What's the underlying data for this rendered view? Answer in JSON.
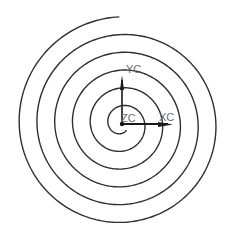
{
  "diagram": {
    "type": "archimedean-spiral",
    "center": [
      122,
      124
    ],
    "spiral": {
      "a": 5,
      "b": 2.83,
      "start_angle_pi": 0.3,
      "end_angle_pi": 11.5,
      "stroke": "#2e2e2e"
    },
    "axes": {
      "x_label": "XC",
      "y_label": "YC",
      "z_label": "ZC",
      "color": "#1a1a1a"
    }
  }
}
